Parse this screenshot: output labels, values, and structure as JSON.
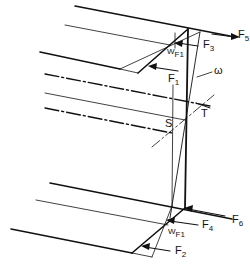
{
  "diagram": {
    "type": "force-diagram",
    "labels": {
      "F5": {
        "main": "F",
        "sub": "5"
      },
      "F3": {
        "main": "F",
        "sub": "3"
      },
      "F1_top": {
        "main": "F",
        "sub": "1"
      },
      "WF1_top": {
        "main": "W",
        "sub": "F1"
      },
      "omega": "ω",
      "T": "T",
      "S": "S",
      "F6": {
        "main": "F",
        "sub": "6"
      },
      "F4": {
        "main": "F",
        "sub": "4"
      },
      "F2": {
        "main": "F",
        "sub": "2"
      },
      "WF1_bottom": {
        "main": "W",
        "sub": "F1"
      }
    },
    "colors": {
      "line": "#111111",
      "background": "#ffffff"
    }
  }
}
